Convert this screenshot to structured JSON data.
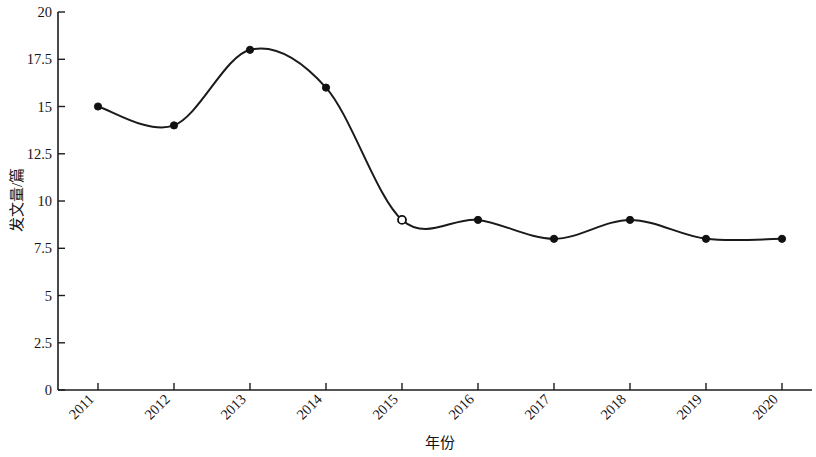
{
  "chart_data": {
    "type": "line",
    "title": "",
    "subtitle": "",
    "xlabel": "年份",
    "ylabel": "发文量/篇",
    "categories": [
      "2011",
      "2012",
      "2013",
      "2014",
      "2015",
      "2016",
      "2017",
      "2018",
      "2019",
      "2020"
    ],
    "values": [
      15,
      14,
      18,
      16,
      9,
      9,
      8,
      9,
      8,
      8
    ],
    "series": [
      {
        "name": "发文量",
        "values": [
          15,
          14,
          18,
          16,
          9,
          9,
          8,
          9,
          8,
          8
        ]
      }
    ],
    "xlim": [
      2011,
      2020
    ],
    "ylim": [
      0,
      20
    ],
    "yticks": [
      0,
      2.5,
      5,
      7.5,
      10,
      12.5,
      15,
      17.5,
      20
    ],
    "ytick_labels": [
      "0",
      "2.5",
      "5",
      "7.5",
      "10",
      "12.5",
      "15",
      "17.5",
      "20"
    ],
    "xticks": [
      2011,
      2012,
      2013,
      2014,
      2015,
      2016,
      2017,
      2018,
      2019,
      2020
    ],
    "xtick_labels": [
      "2011",
      "2012",
      "2013",
      "2014",
      "2015",
      "2016",
      "2017",
      "2018",
      "2019",
      "2020"
    ],
    "xtick_rotation": 45,
    "grid": false,
    "legend": false,
    "legend_position": "none",
    "line_color": "#1a1a1a",
    "marker_style": "circle",
    "markers": [
      {
        "x": "2011",
        "y": 15,
        "style": "filled"
      },
      {
        "x": "2012",
        "y": 14,
        "style": "filled"
      },
      {
        "x": "2013",
        "y": 18,
        "style": "filled"
      },
      {
        "x": "2014",
        "y": 16,
        "style": "filled"
      },
      {
        "x": "2015",
        "y": 9,
        "style": "open"
      },
      {
        "x": "2016",
        "y": 9,
        "style": "filled"
      },
      {
        "x": "2017",
        "y": 8,
        "style": "filled"
      },
      {
        "x": "2018",
        "y": 9,
        "style": "filled"
      },
      {
        "x": "2019",
        "y": 8,
        "style": "filled"
      },
      {
        "x": "2020",
        "y": 8,
        "style": "filled"
      }
    ],
    "interpolation": "smooth-spline",
    "background_color": "#ffffff",
    "axis_color": "#1c1c1c"
  },
  "labels": {
    "y_axis_title": "发文量/篇",
    "x_axis_title": "年份",
    "y_0": "0",
    "y_2_5": "2.5",
    "y_5": "5",
    "y_7_5": "7.5",
    "y_10": "10",
    "y_12_5": "12.5",
    "y_15": "15",
    "y_17_5": "17.5",
    "y_20": "20",
    "x_2011": "2011",
    "x_2012": "2012",
    "x_2013": "2013",
    "x_2014": "2014",
    "x_2015": "2015",
    "x_2016": "2016",
    "x_2017": "2017",
    "x_2018": "2018",
    "x_2019": "2019",
    "x_2020": "2020"
  }
}
